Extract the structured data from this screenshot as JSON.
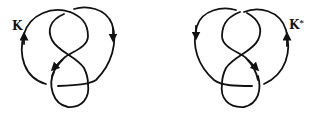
{
  "figure": {
    "stroke_color": "#111111",
    "background": "#ffffff",
    "knots": [
      {
        "id": "left",
        "label": "K",
        "label_sup": "",
        "crossings": 4,
        "arrows": [
          "outer-left-up",
          "outer-right-down",
          "inner-down-left"
        ]
      },
      {
        "id": "right",
        "label": "K",
        "label_sup": "*",
        "crossings": 4,
        "arrows": [
          "outer-left-down",
          "outer-right-up",
          "inner-down-right"
        ]
      }
    ]
  }
}
